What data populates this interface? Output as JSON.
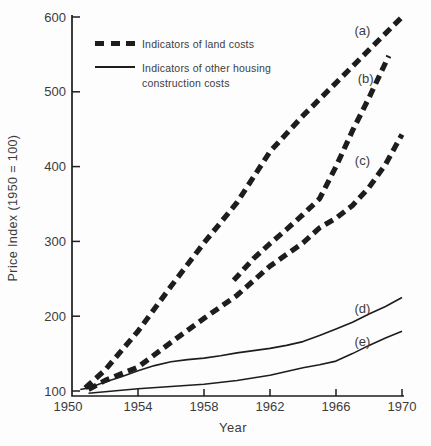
{
  "chart_data": {
    "type": "line",
    "title": "",
    "xlabel": "Year",
    "ylabel": "Price Index (1950 = 100)",
    "xlim": [
      1950,
      1970
    ],
    "ylim": [
      100,
      600
    ],
    "x_ticks": [
      1950,
      1954,
      1958,
      1962,
      1966,
      1970
    ],
    "y_ticks": [
      100,
      200,
      300,
      400,
      500,
      600
    ],
    "grid": false,
    "colors": {
      "line": "#1d1d1d",
      "text": "#3c3c3c",
      "background": "#fdfdfd"
    },
    "legend": {
      "position": "top-left-inside",
      "entries": [
        {
          "label": "Indicators of land costs",
          "style": "dashed"
        },
        {
          "label": "Indicators of other housing construction costs",
          "style": "solid"
        }
      ]
    },
    "series": [
      {
        "name": "land-cost-index-a",
        "annotation": "(a)",
        "annotation_anchor": [
          1967.6,
          581
        ],
        "style": "dashed",
        "points": [
          [
            1950.8,
            104
          ],
          [
            1952,
            128
          ],
          [
            1954,
            180
          ],
          [
            1956,
            240
          ],
          [
            1958,
            298
          ],
          [
            1960,
            352
          ],
          [
            1962,
            420
          ],
          [
            1964,
            468
          ],
          [
            1966,
            512
          ],
          [
            1968,
            556
          ],
          [
            1970,
            600
          ]
        ]
      },
      {
        "name": "land-cost-index-b",
        "annotation": "(b)",
        "annotation_anchor": [
          1967.8,
          517
        ],
        "style": "dashed",
        "points": [
          [
            1959.8,
            248
          ],
          [
            1961,
            277
          ],
          [
            1962,
            297
          ],
          [
            1963,
            316
          ],
          [
            1964,
            336
          ],
          [
            1965,
            357
          ],
          [
            1966,
            400
          ],
          [
            1967,
            448
          ],
          [
            1968,
            492
          ],
          [
            1969.2,
            548
          ]
        ]
      },
      {
        "name": "land-cost-index-c",
        "annotation": "(c)",
        "annotation_anchor": [
          1967.6,
          408
        ],
        "style": "dashed",
        "points": [
          [
            1951,
            102
          ],
          [
            1952,
            114
          ],
          [
            1954,
            132
          ],
          [
            1956,
            165
          ],
          [
            1958,
            197
          ],
          [
            1960,
            228
          ],
          [
            1962,
            267
          ],
          [
            1964,
            298
          ],
          [
            1965,
            318
          ],
          [
            1966,
            331
          ],
          [
            1967,
            348
          ],
          [
            1968,
            372
          ],
          [
            1969,
            403
          ],
          [
            1970,
            443
          ]
        ]
      },
      {
        "name": "housing-construction-cost-index-d",
        "annotation": "(d)",
        "annotation_anchor": [
          1967.6,
          210
        ],
        "style": "solid",
        "points": [
          [
            1950.5,
            102
          ],
          [
            1951,
            104
          ],
          [
            1952,
            112
          ],
          [
            1953,
            119
          ],
          [
            1954,
            127
          ],
          [
            1955,
            134
          ],
          [
            1956,
            139
          ],
          [
            1957,
            142
          ],
          [
            1958,
            144
          ],
          [
            1959,
            147
          ],
          [
            1960,
            151
          ],
          [
            1961,
            154
          ],
          [
            1962,
            157
          ],
          [
            1963,
            161
          ],
          [
            1964,
            166
          ],
          [
            1965,
            174
          ],
          [
            1966,
            183
          ],
          [
            1967,
            192
          ],
          [
            1968,
            203
          ],
          [
            1969,
            213
          ],
          [
            1970,
            225
          ]
        ]
      },
      {
        "name": "housing-construction-cost-index-e",
        "annotation": "(e)",
        "annotation_anchor": [
          1967.6,
          166
        ],
        "style": "solid",
        "points": [
          [
            1951,
            97
          ],
          [
            1952,
            99
          ],
          [
            1954,
            103
          ],
          [
            1956,
            106
          ],
          [
            1958,
            109
          ],
          [
            1960,
            114
          ],
          [
            1962,
            121
          ],
          [
            1964,
            131
          ],
          [
            1965,
            135
          ],
          [
            1966,
            140
          ],
          [
            1967,
            150
          ],
          [
            1968,
            161
          ],
          [
            1969,
            171
          ],
          [
            1970,
            180
          ]
        ]
      }
    ]
  }
}
